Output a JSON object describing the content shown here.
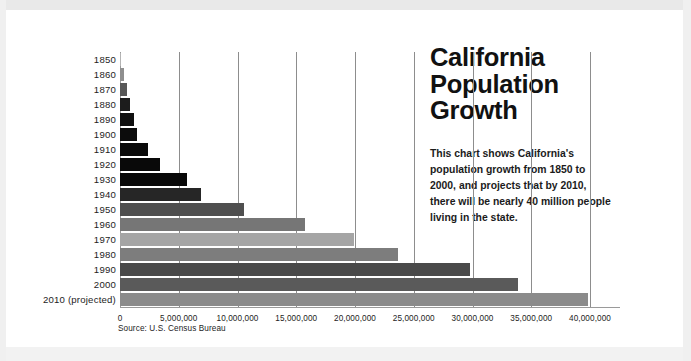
{
  "header": {
    "title": "California\nPopulation\nGrowth",
    "description": "This chart shows California's population growth from 1850 to 2000, and projects that by 2010, there will be nearly 40 million people living in the state."
  },
  "footer": {
    "source": "Source: U.S. Census Bureau"
  },
  "chart_data": {
    "type": "bar",
    "orientation": "horizontal",
    "title": "California Population Growth",
    "xlabel": "",
    "ylabel": "",
    "xlim": [
      0,
      40000000
    ],
    "xticks": [
      0,
      5000000,
      10000000,
      15000000,
      20000000,
      25000000,
      30000000,
      35000000,
      40000000
    ],
    "xticklabels": [
      "0",
      "5,000,000",
      "10,000,000",
      "15,000,000",
      "20,000,000",
      "25,000,000",
      "30,000,000",
      "35,000,000",
      "40,000,000"
    ],
    "grid": true,
    "legend": false,
    "source": "Source: U.S. Census Bureau",
    "categories": [
      "1850",
      "1860",
      "1870",
      "1880",
      "1890",
      "1900",
      "1910",
      "1920",
      "1930",
      "1940",
      "1950",
      "1960",
      "1970",
      "1980",
      "1990",
      "2000",
      "2010 (projected)"
    ],
    "values": [
      92597,
      379994,
      560247,
      864694,
      1213398,
      1485053,
      2377549,
      3426861,
      5677251,
      6907387,
      10586223,
      15717204,
      19953134,
      23667902,
      29760021,
      33871648,
      39800000
    ],
    "bar_colors": [
      "#b4b4b4",
      "#8f8f8f",
      "#585858",
      "#1c1c1c",
      "#101010",
      "#0c0c0c",
      "#0a0a0a",
      "#090909",
      "#080808",
      "#262626",
      "#4f4f4f",
      "#767676",
      "#a5a5a5",
      "#7d7d7d",
      "#4a4a4a",
      "#5a5a5a",
      "#8b8b8b"
    ]
  },
  "colors": {
    "background": "#ffffff",
    "text": "#111111",
    "gridline": "#8d8d8d"
  }
}
